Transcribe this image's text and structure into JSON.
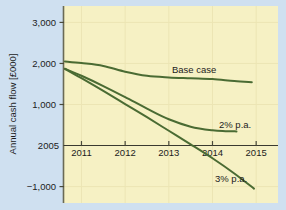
{
  "figure": {
    "background_color": "#cfe0f0",
    "plot_background_color": "#f6f1c4",
    "line_color": "#4a6b33",
    "axis_color": "#3a3a30",
    "grid_color": "#ece5b4"
  },
  "chart_data": {
    "type": "line",
    "title": "",
    "subtitle": "",
    "xlabel": "",
    "ylabel": "Annual cash flow [£000]",
    "x": [
      2011,
      2012,
      2013,
      2014,
      2015
    ],
    "xtick_labels": [
      "2011",
      "2012",
      "2013",
      "2014",
      "2015"
    ],
    "origin_label": "2005",
    "ytick_values": [
      3000,
      2000,
      1000,
      -1000
    ],
    "ytick_labels": [
      "3,000",
      "2,000",
      "1,000",
      "−1,000"
    ],
    "ylim": [
      -1400,
      3400
    ],
    "xlim": [
      2010.6,
      2015.5
    ],
    "grid": true,
    "legend_position": "inline-annotations",
    "series": [
      {
        "name": "Base case",
        "label": "Base case",
        "color": "#4a6b33",
        "points": [
          [
            2010.62,
            2050
          ],
          [
            2011.0,
            2010
          ],
          [
            2011.5,
            1940
          ],
          [
            2012.0,
            1800
          ],
          [
            2012.5,
            1700
          ],
          [
            2013.0,
            1660
          ],
          [
            2013.5,
            1640
          ],
          [
            2014.0,
            1620
          ],
          [
            2014.5,
            1570
          ],
          [
            2014.9,
            1545
          ]
        ]
      },
      {
        "name": "2% p.a.",
        "label": "2% p.a.",
        "color": "#4a6b33",
        "points": [
          [
            2010.62,
            1870
          ],
          [
            2011.0,
            1700
          ],
          [
            2011.5,
            1450
          ],
          [
            2012.0,
            1180
          ],
          [
            2012.5,
            900
          ],
          [
            2013.0,
            640
          ],
          [
            2013.5,
            460
          ],
          [
            2014.0,
            370
          ],
          [
            2014.3,
            350
          ],
          [
            2014.55,
            345
          ]
        ]
      },
      {
        "name": "3% p.a.",
        "label": "3% p.a.",
        "color": "#4a6b33",
        "points": [
          [
            2010.62,
            1870
          ],
          [
            2011.0,
            1640
          ],
          [
            2011.5,
            1330
          ],
          [
            2012.0,
            1010
          ],
          [
            2012.5,
            690
          ],
          [
            2013.0,
            360
          ],
          [
            2013.5,
            30
          ],
          [
            2014.0,
            -310
          ],
          [
            2014.5,
            -680
          ],
          [
            2014.95,
            -1050
          ]
        ]
      }
    ],
    "annotations": [
      {
        "text": "Base case",
        "x_px": 172,
        "y_px": 73
      },
      {
        "text": "2% p.a.",
        "x_px": 219,
        "y_px": 128
      },
      {
        "text": "3% p.a.",
        "x_px": 215,
        "y_px": 182
      }
    ]
  }
}
